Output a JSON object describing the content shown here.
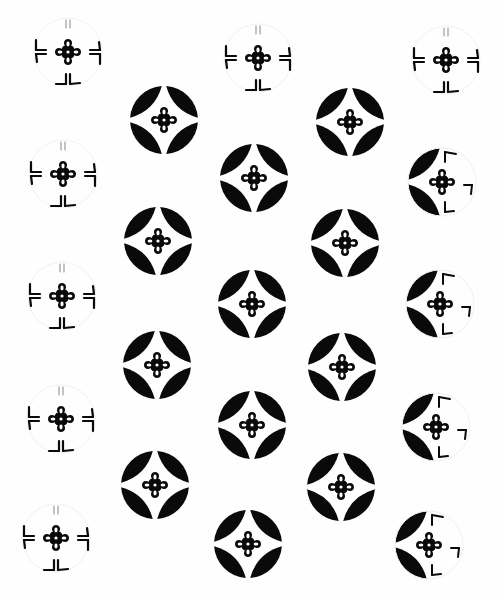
{
  "image": {
    "description": "Black and white decorative pattern of circular crests (shippo-style rings with a four-petal flower in the center), some fully inked and some faded to outline fragments",
    "width": 503,
    "height": 599,
    "background": "#fefefe",
    "ink": "#0a0a0a"
  },
  "motifs": [
    {
      "x": 68,
      "y": 52,
      "r": 34,
      "style": "faded"
    },
    {
      "x": 258,
      "y": 58,
      "r": 34,
      "style": "faded"
    },
    {
      "x": 446,
      "y": 60,
      "r": 34,
      "style": "faded"
    },
    {
      "x": 164,
      "y": 120,
      "r": 34,
      "style": "full"
    },
    {
      "x": 350,
      "y": 122,
      "r": 34,
      "style": "full"
    },
    {
      "x": 63,
      "y": 174,
      "r": 34,
      "style": "faded"
    },
    {
      "x": 254,
      "y": 178,
      "r": 34,
      "style": "full"
    },
    {
      "x": 442,
      "y": 182,
      "r": 34,
      "style": "half"
    },
    {
      "x": 158,
      "y": 241,
      "r": 34,
      "style": "full"
    },
    {
      "x": 345,
      "y": 243,
      "r": 34,
      "style": "full"
    },
    {
      "x": 62,
      "y": 296,
      "r": 34,
      "style": "faded"
    },
    {
      "x": 252,
      "y": 304,
      "r": 34,
      "style": "full"
    },
    {
      "x": 440,
      "y": 304,
      "r": 34,
      "style": "half"
    },
    {
      "x": 157,
      "y": 365,
      "r": 34,
      "style": "full"
    },
    {
      "x": 342,
      "y": 367,
      "r": 34,
      "style": "full"
    },
    {
      "x": 61,
      "y": 419,
      "r": 34,
      "style": "faded"
    },
    {
      "x": 252,
      "y": 425,
      "r": 34,
      "style": "full"
    },
    {
      "x": 436,
      "y": 427,
      "r": 34,
      "style": "half"
    },
    {
      "x": 155,
      "y": 485,
      "r": 34,
      "style": "full"
    },
    {
      "x": 341,
      "y": 487,
      "r": 34,
      "style": "full"
    },
    {
      "x": 56,
      "y": 538,
      "r": 34,
      "style": "faded"
    },
    {
      "x": 248,
      "y": 544,
      "r": 34,
      "style": "full"
    },
    {
      "x": 429,
      "y": 545,
      "r": 34,
      "style": "half"
    }
  ]
}
